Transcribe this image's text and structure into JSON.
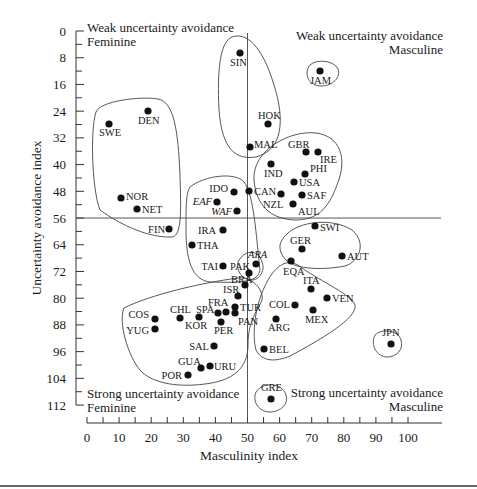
{
  "chart_data": {
    "type": "scatter",
    "title": "",
    "xlabel": "Masculinity index",
    "ylabel": "Uncertainty avoidance index",
    "xlim": [
      0,
      110
    ],
    "ylim": [
      0,
      112
    ],
    "y_inverted": true,
    "x_ticks": [
      0,
      10,
      20,
      30,
      40,
      50,
      60,
      70,
      80,
      90,
      100
    ],
    "y_ticks": [
      0,
      8,
      16,
      24,
      32,
      40,
      48,
      56,
      64,
      72,
      80,
      88,
      96,
      104,
      112
    ],
    "grid": false,
    "dividers": {
      "x": 50,
      "y": 56
    },
    "quadrant_labels": {
      "top_left": [
        "Weak uncertainty avoidance",
        "Feminine"
      ],
      "top_right": [
        "Weak uncertainty avoidance",
        "Masculine"
      ],
      "bottom_left": [
        "Strong uncertainty avoidance",
        "Feminine"
      ],
      "bottom_right": [
        "Strong uncertainty avoidance",
        "Masculine"
      ]
    },
    "points": [
      {
        "label": "SIN",
        "x": 48,
        "y": 8
      },
      {
        "label": "JAM",
        "x": 68,
        "y": 13
      },
      {
        "label": "HOK",
        "x": 57,
        "y": 29
      },
      {
        "label": "MAL",
        "x": 50,
        "y": 36
      },
      {
        "label": "DEN",
        "x": 16,
        "y": 23
      },
      {
        "label": "SWE",
        "x": 5,
        "y": 29
      },
      {
        "label": "NOR",
        "x": 8,
        "y": 50
      },
      {
        "label": "NET",
        "x": 14,
        "y": 53
      },
      {
        "label": "FIN",
        "x": 26,
        "y": 59
      },
      {
        "label": "GBR",
        "x": 66,
        "y": 35
      },
      {
        "label": "IRE",
        "x": 68,
        "y": 35
      },
      {
        "label": "IND",
        "x": 56,
        "y": 40
      },
      {
        "label": "PHI",
        "x": 64,
        "y": 44
      },
      {
        "label": "USA",
        "x": 62,
        "y": 46
      },
      {
        "label": "CAN",
        "x": 52,
        "y": 48
      },
      {
        "label": "NZL",
        "x": 58,
        "y": 49
      },
      {
        "label": "SAF",
        "x": 63,
        "y": 49
      },
      {
        "label": "AUL",
        "x": 61,
        "y": 51
      },
      {
        "label": "IDO",
        "x": 46,
        "y": 48
      },
      {
        "label": "EAF",
        "x": 41,
        "y": 52,
        "italic": true
      },
      {
        "label": "WAF",
        "x": 46,
        "y": 54,
        "italic": true
      },
      {
        "label": "IRA",
        "x": 43,
        "y": 59
      },
      {
        "label": "THA",
        "x": 34,
        "y": 64
      },
      {
        "label": "SWI",
        "x": 70,
        "y": 58
      },
      {
        "label": "GER",
        "x": 66,
        "y": 65
      },
      {
        "label": "AUT",
        "x": 79,
        "y": 70
      },
      {
        "label": "ARA",
        "x": 53,
        "y": 68,
        "italic": true
      },
      {
        "label": "TAI",
        "x": 45,
        "y": 69
      },
      {
        "label": "PAK",
        "x": 50,
        "y": 70
      },
      {
        "label": "EQA",
        "x": 63,
        "y": 67
      },
      {
        "label": "BRA",
        "x": 49,
        "y": 76
      },
      {
        "label": "ISR",
        "x": 47,
        "y": 81
      },
      {
        "label": "ITA",
        "x": 70,
        "y": 75
      },
      {
        "label": "VEN",
        "x": 73,
        "y": 76
      },
      {
        "label": "COL",
        "x": 64,
        "y": 80
      },
      {
        "label": "MEX",
        "x": 69,
        "y": 82
      },
      {
        "label": "ARG",
        "x": 56,
        "y": 86
      },
      {
        "label": "FRA",
        "x": 43,
        "y": 86
      },
      {
        "label": "TUR",
        "x": 45,
        "y": 85
      },
      {
        "label": "PAN",
        "x": 44,
        "y": 86
      },
      {
        "label": "SPA",
        "x": 42,
        "y": 86
      },
      {
        "label": "PER",
        "x": 42,
        "y": 87
      },
      {
        "label": "CHL",
        "x": 28,
        "y": 86
      },
      {
        "label": "KOR",
        "x": 39,
        "y": 85
      },
      {
        "label": "COS",
        "x": 21,
        "y": 86
      },
      {
        "label": "YUG",
        "x": 21,
        "y": 88
      },
      {
        "label": "SAL",
        "x": 40,
        "y": 94
      },
      {
        "label": "BEL",
        "x": 54,
        "y": 94
      },
      {
        "label": "JPN",
        "x": 95,
        "y": 92
      },
      {
        "label": "GUA",
        "x": 37,
        "y": 101
      },
      {
        "label": "URU",
        "x": 38,
        "y": 100
      },
      {
        "label": "POR",
        "x": 31,
        "y": 104
      },
      {
        "label": "GRE",
        "x": 57,
        "y": 112
      }
    ]
  },
  "render": {
    "points": [
      {
        "label": "SIN",
        "cx": 240,
        "cy": 53,
        "lx": 230,
        "ly": 66,
        "anchor": "start"
      },
      {
        "label": "JAM",
        "cx": 320,
        "cy": 71,
        "lx": 310,
        "ly": 84,
        "anchor": "start"
      },
      {
        "label": "HOK",
        "cx": 268,
        "cy": 124,
        "lx": 258,
        "ly": 119,
        "anchor": "start"
      },
      {
        "label": "MAL",
        "cx": 250,
        "cy": 147,
        "lx": 254,
        "ly": 148,
        "anchor": "start"
      },
      {
        "label": "DEN",
        "cx": 148,
        "cy": 111,
        "lx": 138,
        "ly": 124,
        "anchor": "start"
      },
      {
        "label": "SWE",
        "cx": 109,
        "cy": 124,
        "lx": 99,
        "ly": 136,
        "anchor": "start"
      },
      {
        "label": "NOR",
        "cx": 121,
        "cy": 198,
        "lx": 126,
        "ly": 200,
        "anchor": "start"
      },
      {
        "label": "NET",
        "cx": 137,
        "cy": 209,
        "lx": 142,
        "ly": 213,
        "anchor": "start"
      },
      {
        "label": "FIN",
        "cx": 169,
        "cy": 229,
        "lx": 165,
        "ly": 233,
        "anchor": "end"
      },
      {
        "label": "GBR",
        "cx": 306,
        "cy": 152,
        "lx": 288,
        "ly": 148,
        "anchor": "start"
      },
      {
        "label": "IRE",
        "cx": 318,
        "cy": 152,
        "lx": 320,
        "ly": 163,
        "anchor": "start"
      },
      {
        "label": "IND",
        "cx": 271,
        "cy": 164,
        "lx": 264,
        "ly": 177,
        "anchor": "start"
      },
      {
        "label": "PHI",
        "cx": 305,
        "cy": 174,
        "lx": 310,
        "ly": 172,
        "anchor": "start"
      },
      {
        "label": "USA",
        "cx": 294,
        "cy": 182,
        "lx": 299,
        "ly": 186,
        "anchor": "start"
      },
      {
        "label": "CAN",
        "cx": 249,
        "cy": 191,
        "lx": 254,
        "ly": 195,
        "anchor": "start"
      },
      {
        "label": "NZL",
        "cx": 281,
        "cy": 194,
        "lx": 263,
        "ly": 208,
        "anchor": "start"
      },
      {
        "label": "SAF",
        "cx": 302,
        "cy": 195,
        "lx": 307,
        "ly": 199,
        "anchor": "start"
      },
      {
        "label": "AUL",
        "cx": 293,
        "cy": 204,
        "lx": 298,
        "ly": 215,
        "anchor": "start"
      },
      {
        "label": "IDO",
        "cx": 234,
        "cy": 192,
        "lx": 228,
        "ly": 192,
        "anchor": "end"
      },
      {
        "label": "EAF",
        "cx": 217,
        "cy": 202,
        "lx": 212,
        "ly": 205,
        "anchor": "end",
        "italic": true
      },
      {
        "label": "WAF",
        "cx": 237,
        "cy": 211,
        "lx": 232,
        "ly": 215,
        "anchor": "end",
        "italic": true
      },
      {
        "label": "IRA",
        "cx": 223,
        "cy": 230,
        "lx": 216,
        "ly": 234,
        "anchor": "end"
      },
      {
        "label": "THA",
        "cx": 192,
        "cy": 245,
        "lx": 197,
        "ly": 249,
        "anchor": "start"
      },
      {
        "label": "SWI",
        "cx": 315,
        "cy": 226,
        "lx": 320,
        "ly": 231,
        "anchor": "start"
      },
      {
        "label": "GER",
        "cx": 302,
        "cy": 249,
        "lx": 290,
        "ly": 244,
        "anchor": "start"
      },
      {
        "label": "AUT",
        "cx": 342,
        "cy": 256,
        "lx": 347,
        "ly": 260,
        "anchor": "start"
      },
      {
        "label": "ARA",
        "cx": 256,
        "cy": 264,
        "lx": 248,
        "ly": 258,
        "anchor": "start",
        "italic": true
      },
      {
        "label": "TAI",
        "cx": 223,
        "cy": 266,
        "lx": 218,
        "ly": 270,
        "anchor": "end"
      },
      {
        "label": "PAK",
        "cx": 249,
        "cy": 273,
        "lx": 230,
        "ly": 270,
        "anchor": "start"
      },
      {
        "label": "EQA",
        "cx": 291,
        "cy": 261,
        "lx": 283,
        "ly": 275,
        "anchor": "start"
      },
      {
        "label": "BRA",
        "cx": 245,
        "cy": 285,
        "lx": 231,
        "ly": 283,
        "anchor": "start"
      },
      {
        "label": "ISR",
        "cx": 238,
        "cy": 296,
        "lx": 223,
        "ly": 293,
        "anchor": "start"
      },
      {
        "label": "ITA",
        "cx": 311,
        "cy": 289,
        "lx": 303,
        "ly": 284,
        "anchor": "start"
      },
      {
        "label": "VEN",
        "cx": 327,
        "cy": 298,
        "lx": 332,
        "ly": 302,
        "anchor": "start"
      },
      {
        "label": "COL",
        "cx": 295,
        "cy": 305,
        "lx": 290,
        "ly": 308,
        "anchor": "end"
      },
      {
        "label": "MEX",
        "cx": 313,
        "cy": 310,
        "lx": 305,
        "ly": 323,
        "anchor": "start"
      },
      {
        "label": "ARG",
        "cx": 276,
        "cy": 319,
        "lx": 268,
        "ly": 331,
        "anchor": "start"
      },
      {
        "label": "FRA",
        "cx": 226,
        "cy": 312,
        "lx": 208,
        "ly": 306,
        "anchor": "start"
      },
      {
        "label": "TUR",
        "cx": 235,
        "cy": 307,
        "lx": 240,
        "ly": 311,
        "anchor": "start"
      },
      {
        "label": "PAN",
        "cx": 235,
        "cy": 313,
        "lx": 238,
        "ly": 325,
        "anchor": "start"
      },
      {
        "label": "SPA",
        "cx": 218,
        "cy": 313,
        "lx": 196,
        "ly": 313,
        "anchor": "start"
      },
      {
        "label": "PER",
        "cx": 221,
        "cy": 322,
        "lx": 214,
        "ly": 334,
        "anchor": "start"
      },
      {
        "label": "CHL",
        "cx": 180,
        "cy": 318,
        "lx": 170,
        "ly": 313,
        "anchor": "start"
      },
      {
        "label": "KOR",
        "cx": 199,
        "cy": 317,
        "lx": 185,
        "ly": 329,
        "anchor": "start"
      },
      {
        "label": "COS",
        "cx": 155,
        "cy": 319,
        "lx": 149,
        "ly": 318,
        "anchor": "end"
      },
      {
        "label": "YUG",
        "cx": 155,
        "cy": 329,
        "lx": 149,
        "ly": 334,
        "anchor": "end"
      },
      {
        "label": "SAL",
        "cx": 214,
        "cy": 346,
        "lx": 209,
        "ly": 350,
        "anchor": "end"
      },
      {
        "label": "BEL",
        "cx": 264,
        "cy": 349,
        "lx": 269,
        "ly": 353,
        "anchor": "start"
      },
      {
        "label": "JPN",
        "cx": 391,
        "cy": 344,
        "lx": 382,
        "ly": 336,
        "anchor": "start"
      },
      {
        "label": "GUA",
        "cx": 201,
        "cy": 368,
        "lx": 178,
        "ly": 365,
        "anchor": "start"
      },
      {
        "label": "URU",
        "cx": 210,
        "cy": 366,
        "lx": 214,
        "ly": 370,
        "anchor": "start"
      },
      {
        "label": "POR",
        "cx": 188,
        "cy": 375,
        "lx": 182,
        "ly": 379,
        "anchor": "end"
      },
      {
        "label": "GRE",
        "cx": 271,
        "cy": 399,
        "lx": 261,
        "ly": 391,
        "anchor": "start"
      }
    ],
    "clusters": [
      "M 96 112 C 100 101, 140 96, 158 99 C 174 102, 178 130, 180 175 C 181 210, 182 236, 172 237 C 150 238, 122 226, 100 210 C 92 190, 90 130, 96 112 Z",
      "M 232 37 C 246 32, 262 45, 274 85 C 285 120, 283 150, 256 157 C 236 160, 222 150, 219 110 C 217 70, 220 42, 232 37 Z",
      "M 310 65 C 316 59, 334 60, 338 69 C 341 77, 333 86, 321 86 C 309 86, 303 74, 310 65 Z",
      "M 254 180 C 252 150, 290 130, 316 133 C 340 136, 348 158, 337 185 C 328 210, 316 220, 295 220 C 270 219, 256 205, 254 180 Z",
      "M 190 187 C 205 175, 236 172, 244 182 C 254 195, 256 235, 260 270 C 258 282, 243 283, 210 282 C 192 280, 186 260, 186 230 C 186 205, 186 193, 190 187 Z",
      "M 238 262 C 244 250, 258 248, 262 262 C 266 272, 258 281, 250 280 C 243 279, 236 272, 238 262 Z",
      "M 282 240 C 292 222, 330 216, 352 230 C 368 244, 358 262, 345 266 C 325 270, 296 270, 286 260 C 280 254, 278 246, 282 240 Z",
      "M 124 308 C 150 295, 200 283, 238 278 C 252 276, 264 290, 262 300 C 258 310, 248 320, 248 345 C 248 362, 240 380, 205 384 C 175 388, 150 382, 140 370 C 128 356, 118 322, 124 308 Z",
      "M 268 280 C 276 266, 288 256, 302 268 C 322 282, 352 295, 355 305 C 358 318, 320 340, 290 356 C 276 362, 262 362, 256 350 C 252 335, 254 305, 268 280 Z",
      "M 375 335 C 382 328, 398 330, 401 340 C 404 350, 396 357, 387 357 C 377 357, 370 345, 375 335 Z",
      "M 256 392 C 262 382, 282 382, 286 395 C 289 404, 280 412, 270 412 C 259 412, 252 402, 256 392 Z"
    ]
  }
}
